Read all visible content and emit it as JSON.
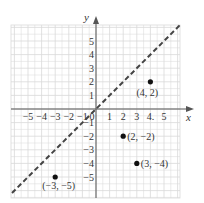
{
  "chart_data": {
    "type": "scatter",
    "title": "",
    "xlabel": "x",
    "ylabel": "y",
    "xlim": [
      -6,
      6
    ],
    "ylim": [
      -6,
      6
    ],
    "grid": true,
    "x_ticks": [
      -5,
      -4,
      -3,
      -2,
      -1,
      0,
      1,
      2,
      3,
      4,
      5
    ],
    "x_tick_labels": [
      "−5",
      "−4",
      "−3",
      "−2",
      "−1",
      "0",
      "1",
      "2",
      "3",
      "4.",
      "5"
    ],
    "y_ticks": [
      -5,
      -4,
      -3,
      -2,
      -1,
      1,
      2,
      3,
      4,
      5
    ],
    "y_tick_labels": [
      "−5",
      "−4",
      "−3",
      "−2",
      "−1",
      "1",
      "2",
      "3",
      "4",
      "5"
    ],
    "series": [
      {
        "name": "points",
        "type": "scatter",
        "points": [
          {
            "x": 4,
            "y": 2,
            "label": "(4, 2)"
          },
          {
            "x": 2,
            "y": -2,
            "label": "(2, −2)"
          },
          {
            "x": 3,
            "y": -4,
            "label": "(3, −4)"
          },
          {
            "x": -3,
            "y": -5,
            "label": "(−3, −5)"
          }
        ]
      },
      {
        "name": "y = x",
        "type": "line",
        "style": "dashed",
        "x": [
          -6,
          6
        ],
        "y": [
          -6,
          6
        ]
      }
    ]
  },
  "colors": {
    "grid": "#d9d9d9",
    "axis": "#555555",
    "line": "#444444",
    "point": "#111111",
    "text": "#333333"
  }
}
